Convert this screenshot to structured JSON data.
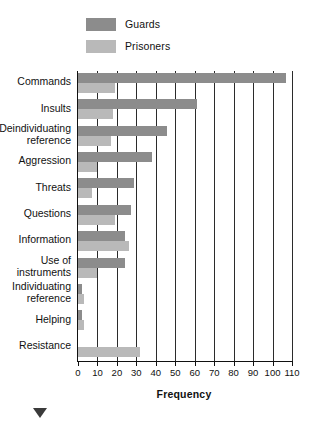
{
  "chart_data": {
    "type": "bar",
    "orientation": "horizontal",
    "title": "",
    "xlabel": "Frequency",
    "ylabel": "",
    "xlim": [
      0,
      110
    ],
    "xticks": [
      0,
      10,
      20,
      30,
      40,
      50,
      60,
      70,
      80,
      90,
      100,
      110
    ],
    "grid": true,
    "legend_position": "top",
    "categories": [
      "Commands",
      "Insults",
      "Deindividuating reference",
      "Aggression",
      "Threats",
      "Questions",
      "Information",
      "Use of instruments",
      "Individuating reference",
      "Helping",
      "Resistance"
    ],
    "series": [
      {
        "name": "Guards",
        "color": "#8c8c8c",
        "values": [
          107,
          61,
          46,
          38,
          29,
          27,
          24,
          24,
          2,
          2,
          0
        ]
      },
      {
        "name": "Prisoners",
        "color": "#b9b9b9",
        "values": [
          19,
          18,
          17,
          10,
          7,
          19,
          26,
          10,
          3,
          3,
          32
        ]
      }
    ]
  },
  "legend": {
    "items": [
      {
        "label": "Guards",
        "color": "#8c8c8c"
      },
      {
        "label": "Prisoners",
        "color": "#b9b9b9"
      }
    ]
  },
  "axis": {
    "x_title": "Frequency",
    "tick_labels": [
      "0",
      "10",
      "20",
      "30",
      "40",
      "50",
      "60",
      "70",
      "80",
      "90",
      "100",
      "110"
    ]
  },
  "category_labels": [
    {
      "lines": [
        "Commands"
      ]
    },
    {
      "lines": [
        "Insults"
      ]
    },
    {
      "lines": [
        "Deindividuating",
        "reference"
      ]
    },
    {
      "lines": [
        "Aggression"
      ]
    },
    {
      "lines": [
        "Threats"
      ]
    },
    {
      "lines": [
        "Questions"
      ]
    },
    {
      "lines": [
        "Information"
      ]
    },
    {
      "lines": [
        "Use of",
        "instruments"
      ]
    },
    {
      "lines": [
        "Individuating",
        "reference"
      ]
    },
    {
      "lines": [
        "Helping"
      ]
    },
    {
      "lines": [
        "Resistance"
      ]
    }
  ],
  "colors": {
    "guards": "#8c8c8c",
    "prisoners": "#b9b9b9",
    "axis": "#111111",
    "grid": "#2b2b2b",
    "background": "#ffffff",
    "marker": "#3a3a3a"
  }
}
